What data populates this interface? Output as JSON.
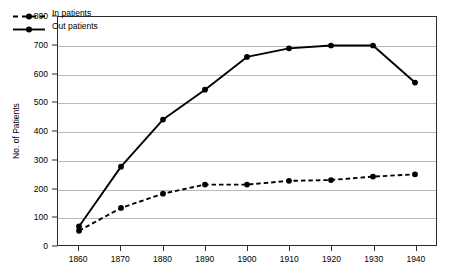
{
  "chart_data": {
    "type": "line",
    "title": "",
    "xlabel": "",
    "ylabel": "No. of Patients",
    "x": [
      1860,
      1870,
      1880,
      1890,
      1900,
      1910,
      1920,
      1930,
      1940
    ],
    "xtick_labels": [
      "1860",
      "1870",
      "1880",
      "1890",
      "1900",
      "1910",
      "1920",
      "1930",
      "1940"
    ],
    "ytick_labels": [
      "0",
      "100",
      "200",
      "300",
      "400",
      "500",
      "600",
      "700",
      "800"
    ],
    "yticks": [
      0,
      100,
      200,
      300,
      400,
      500,
      600,
      700,
      800
    ],
    "ylim": [
      0,
      800
    ],
    "xlim": [
      1855,
      1945
    ],
    "grid": "horizontal",
    "legend_position": "top-left-inside",
    "series": [
      {
        "name": "In patients",
        "style": "dashed",
        "marker": "circle",
        "color": "#000000",
        "values": [
          50,
          130,
          180,
          212,
          212,
          225,
          228,
          240,
          248
        ]
      },
      {
        "name": "Out patients",
        "style": "solid",
        "marker": "circle",
        "color": "#000000",
        "values": [
          65,
          275,
          440,
          545,
          660,
          690,
          700,
          700,
          570
        ]
      }
    ]
  },
  "legend": {
    "items": [
      {
        "label": "In patients"
      },
      {
        "label": "Out patients"
      }
    ]
  }
}
